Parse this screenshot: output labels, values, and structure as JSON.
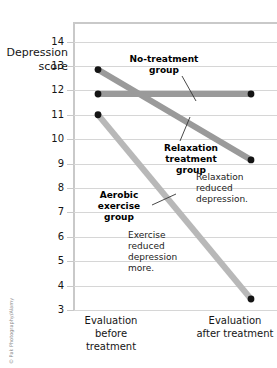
{
  "chart_data": {
    "type": "line",
    "title": "",
    "xlabel": "",
    "ylabel": "Depression score",
    "categories": [
      "Evaluation before treatment",
      "Evaluation after treatment"
    ],
    "x": [
      0,
      1
    ],
    "ylim": [
      3,
      14.8
    ],
    "yticks": [
      3,
      4,
      5,
      6,
      7,
      8,
      9,
      10,
      11,
      12,
      13,
      14
    ],
    "ytick_labels": [
      "3",
      "4",
      "5",
      "6",
      "7",
      "8",
      "9",
      "10",
      "11",
      "12",
      "13",
      "14"
    ],
    "grid": true,
    "legend": "none",
    "series": [
      {
        "name": "No-treatment group",
        "values": [
          11.85,
          11.85
        ],
        "color": "#9a9a9a",
        "marker": "filled-circle"
      },
      {
        "name": "Relaxation treatment group",
        "values": [
          12.85,
          9.15
        ],
        "color": "#9a9a9a",
        "marker": "filled-circle"
      },
      {
        "name": "Aerobic exercise group",
        "values": [
          11.0,
          3.45
        ],
        "color": "#b8b8b8",
        "marker": "filled-circle"
      }
    ],
    "annotations": [
      "No-treatment group",
      "Relaxation treatment group",
      "Aerobic exercise group",
      "Relaxation reduced depression.",
      "Exercise reduced depression more."
    ]
  },
  "axis": {
    "y_title_line1": "Depression",
    "y_title_line2": "score"
  },
  "labels": {
    "no_treatment": "No-treatment group",
    "relaxation": "Relaxation treatment group",
    "aerobic": "Aerobic exercise group"
  },
  "notes": {
    "relaxation_note": "Relaxation reduced depression.",
    "exercise_note": "Exercise reduced depression more."
  },
  "xaxis": {
    "left_label": "Evaluation before treatment",
    "right_label": "Evaluation after treatment"
  },
  "credit": {
    "text": "© Pak Photography/Alamy"
  },
  "colors": {
    "line_dark": "#9a9a9a",
    "line_light": "#b8b8b8",
    "marker": "#141414",
    "grid": "#d6d6d6",
    "frame": "#c9c9c9"
  }
}
